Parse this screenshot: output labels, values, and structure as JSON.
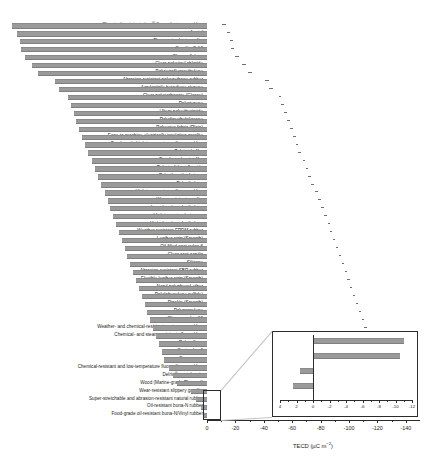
{
  "chart_data": {
    "type": "bar",
    "orientation": "horizontal",
    "title": "",
    "xlabel": "TECD (µC m⁻²)",
    "ylabel": "",
    "xlim": [
      0,
      -150
    ],
    "xticks": [
      0,
      -20,
      -40,
      -60,
      -80,
      -100,
      -120,
      -140
    ],
    "xtick_labels": [
      "0",
      "-20",
      "-40",
      "-60",
      "-80",
      "-100",
      "-120",
      "-140"
    ],
    "grid": false,
    "bar_color": "#9a9a9a",
    "categories": [
      "Chemical-resistant viton® fluoroelastomer rubber",
      "Acetal",
      "Flame-retardant garolite",
      "Garolite G-10",
      "Clear cellulose",
      "Clear polyvinyl chloride",
      "Polytetrafluoroethylene",
      "Abrasion-resistant polyurethane rubber",
      "Acrylonitrile butadiene styrene",
      "Clear polycarbonate (Glossy)",
      "Polystyrene",
      "Ultem polyetherimide",
      "Polydimethylsiloxane",
      "Polyester fabric (Plain)",
      "Easy-to-machine electrically insulating garolite",
      "Food-grade high-temperature silicone rubber",
      "Polyimide film",
      "Duralar polyester film",
      "Polyvinylidene fluoride",
      "Polyetheretherketone",
      "Polyethylene",
      "High-temperature silicone rubber",
      "Wear-resistant garolite",
      "Low-density polyethylene",
      "High impact polystyrene",
      "High-density polyethylene",
      "Weather-resistant EPDM rubber",
      "Leather strip (Smooth)",
      "Oil-filled cast nylon 6",
      "Clear cast acrylic",
      "Silicone",
      "Abrasion-resistant SBR rubber",
      "Flexible leather strip (Smooth)",
      "Noryl polyphenyl ether",
      "Poly(phenylene sulfide)",
      "Pigskin (Smooth)",
      "Polypropylene",
      "Slippery nylon 66",
      "Weather- and chemical-resistant santoprene rubber",
      "Chemical- and steam-resistant aflas rubber",
      "Polysulfone",
      "Cast nylon 6",
      "Copy paper",
      "Chemical-resistant and low-temperature fluorosilicone rubber",
      "Delrin® acetal resin",
      "Wood (Marine-grade Plywood)",
      "Wear-resistant slippery garolite",
      "Super-stretchable and abrasion-resistant natural rubber",
      "Oil-resistant buna-N rubber",
      "Food-grade oil-resistant buna-N/Vinyl rubber"
    ],
    "values": [
      -137.0,
      -134.0,
      -132.0,
      -131.0,
      -128.0,
      -123.0,
      -119.0,
      -107.0,
      -104.0,
      -98.0,
      -96.0,
      -94.0,
      -92.0,
      -90.0,
      -88.0,
      -86.0,
      -84.0,
      -81.0,
      -79.0,
      -77.0,
      -75.0,
      -72.0,
      -70.0,
      -68.0,
      -66.0,
      -64.0,
      -62.0,
      -60.0,
      -58.0,
      -56.0,
      -54.0,
      -52.0,
      -50.0,
      -48.0,
      -46.0,
      -44.0,
      -42.0,
      -40.0,
      -38.0,
      -36.0,
      -34.0,
      -32.0,
      -30.0,
      -27.0,
      -24.0,
      -21.0,
      -11.0,
      -8.0,
      -4.0,
      -2.0
    ],
    "errors": [
      3.0,
      2.5,
      2.5,
      2.5,
      2.5,
      2.5,
      2.5,
      2.5,
      2.5,
      2.0,
      2.0,
      2.0,
      2.0,
      2.0,
      2.0,
      2.0,
      2.0,
      2.0,
      2.0,
      2.0,
      2.0,
      2.0,
      2.0,
      2.0,
      2.0,
      1.5,
      1.5,
      1.5,
      1.5,
      1.5,
      1.5,
      1.5,
      1.5,
      1.5,
      1.5,
      1.5,
      1.5,
      1.5,
      1.5,
      1.5,
      1.5,
      1.5,
      1.5,
      1.5,
      1.5,
      1.5,
      1.0,
      1.0,
      1.0,
      1.0
    ],
    "inset": {
      "type": "bar",
      "orientation": "horizontal",
      "xlim": [
        4,
        -12
      ],
      "xticks": [
        4,
        2,
        0,
        -2,
        -4,
        -6,
        -8,
        -10,
        -12
      ],
      "xtick_labels": [
        "4",
        "2",
        "0",
        "-2",
        "-4",
        "-6",
        "-8",
        "-10",
        "-12"
      ],
      "categories": [
        "Wear-resistant slippery garolite",
        "Super-stretchable and abrasion-resistant natural rubber",
        "Oil-resistant buna-N rubber",
        "Food-grade oil-resistant buna-N/Vinyl rubber"
      ],
      "values": [
        -11.0,
        -10.5,
        1.6,
        2.4
      ]
    }
  }
}
